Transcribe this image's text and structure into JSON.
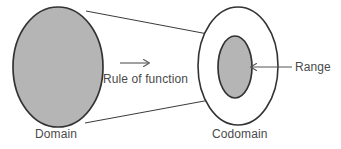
{
  "figure": {
    "background_color": "#ffffff",
    "stroke_color": "#333333",
    "fill_color": "#b5b5b5",
    "text_color": "#4a4a4a",
    "labels": {
      "domain": "Domain",
      "codomain": "Codomain",
      "range": "Range",
      "rule": "Rule of function"
    },
    "shapes": {
      "domain_ellipse": {
        "cx": 58,
        "cy": 67,
        "rx": 45,
        "ry": 60,
        "fill": "#b5b5b5"
      },
      "codomain_ellipse": {
        "cx": 238,
        "cy": 66,
        "rx": 40,
        "ry": 59,
        "fill": "none"
      },
      "range_ellipse": {
        "cx": 235,
        "cy": 67,
        "rx": 17,
        "ry": 31,
        "fill": "#b5b5b5"
      }
    },
    "connectors": {
      "top_line": {
        "x1": 86,
        "y1": 11,
        "x2": 229,
        "y2": 38
      },
      "bottom_line": {
        "x1": 85,
        "y1": 123,
        "x2": 226,
        "y2": 97
      },
      "rule_arrow": {
        "x1": 120,
        "y1": 63,
        "x2": 149,
        "y2": 63
      },
      "range_leader": {
        "x1": 292,
        "y1": 67,
        "x2": 251,
        "y2": 67
      }
    }
  }
}
